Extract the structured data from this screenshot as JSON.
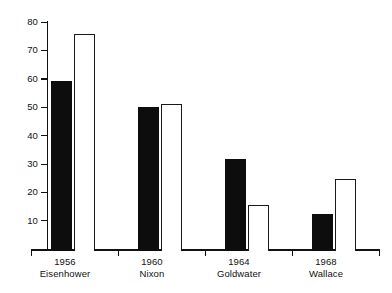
{
  "chart_data": {
    "type": "bar",
    "title": "",
    "subtitle": "",
    "xlabel": "",
    "ylabel": "",
    "ylim": [
      0,
      80
    ],
    "yticks": [
      10,
      20,
      30,
      40,
      50,
      60,
      70,
      80
    ],
    "ytick_labels": [
      "10",
      "20",
      "30",
      "40",
      "50",
      "60",
      "70",
      "80"
    ],
    "grid": false,
    "legend": "none",
    "categories": [
      "1956",
      "1960",
      "1964",
      "1968"
    ],
    "category_sublabels": [
      "Eisenhower",
      "Nixon",
      "Goldwater",
      "Wallace"
    ],
    "series": [
      {
        "name": "filled",
        "style": "solid-black",
        "color": "#0d0d0d",
        "values": [
          59,
          50,
          32,
          13
        ]
      },
      {
        "name": "outline",
        "style": "white-outlined",
        "color": "#ffffff",
        "values": [
          75,
          51,
          16,
          25
        ]
      }
    ]
  },
  "axis": {
    "y_tick_labels": [
      "80",
      "70",
      "60",
      "50",
      "40",
      "30",
      "20",
      "10"
    ],
    "y_tick_values": [
      80,
      70,
      60,
      50,
      40,
      30,
      20,
      10
    ]
  },
  "categories": [
    {
      "year": "1956",
      "name": "Eisenhower"
    },
    {
      "year": "1960",
      "name": "Nixon"
    },
    {
      "year": "1964",
      "name": "Goldwater"
    },
    {
      "year": "1968",
      "name": "Wallace"
    }
  ],
  "colors": {
    "filled_bar": "#0d0d0d",
    "outline_bar_fill": "#ffffff",
    "outline_bar_stroke": "#1a1a1a",
    "axis": "#111111",
    "background": "#ffffff",
    "text": "#111111"
  }
}
